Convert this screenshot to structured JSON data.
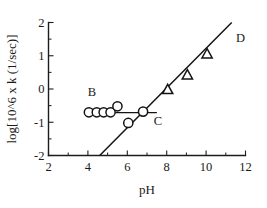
{
  "chart_data": {
    "type": "scatter",
    "title": "",
    "xlabel": "pH",
    "ylabel": "log[10^6 x k (1/sec)]",
    "xlim": [
      2,
      12
    ],
    "ylim": [
      -2,
      2
    ],
    "xticks": [
      "2",
      "4",
      "6",
      "8",
      "10",
      "12"
    ],
    "xtick_values": [
      2,
      4,
      6,
      8,
      10,
      12
    ],
    "yticks": [
      "2",
      "1",
      "0",
      "-1",
      "-2"
    ],
    "ytick_values": [
      2,
      1,
      0,
      -1,
      -2
    ],
    "grid": false,
    "legend": "none",
    "series": [
      {
        "name": "circles",
        "marker": "circle",
        "points": [
          {
            "x": 4.05,
            "y": -0.7
          },
          {
            "x": 4.45,
            "y": -0.7
          },
          {
            "x": 4.8,
            "y": -0.7
          },
          {
            "x": 5.15,
            "y": -0.7
          },
          {
            "x": 5.5,
            "y": -0.52
          },
          {
            "x": 6.05,
            "y": -1.02
          },
          {
            "x": 6.8,
            "y": -0.68
          }
        ]
      },
      {
        "name": "triangles",
        "marker": "triangle",
        "points": [
          {
            "x": 8.05,
            "y": -0.02
          },
          {
            "x": 9.05,
            "y": 0.42
          },
          {
            "x": 10.05,
            "y": 1.05
          }
        ]
      }
    ],
    "fits": [
      {
        "name": "ascending-line",
        "label": "D",
        "x0": 4.6,
        "y0": -2.0,
        "x1": 11.3,
        "y1": 2.0
      },
      {
        "name": "plateau-line",
        "label": "C",
        "x0": 3.9,
        "y0": -0.71,
        "x1": 7.5,
        "y1": -0.71
      }
    ],
    "annotations": [
      {
        "text": "B",
        "x": 4.2,
        "y": -0.22
      },
      {
        "text": "C",
        "x": 7.55,
        "y": -1.08
      },
      {
        "text": "D",
        "x": 11.75,
        "y": 1.42
      }
    ]
  },
  "axes": {
    "x_title": "pH",
    "y_title": "log[10^6 x k (1/sec)]"
  }
}
